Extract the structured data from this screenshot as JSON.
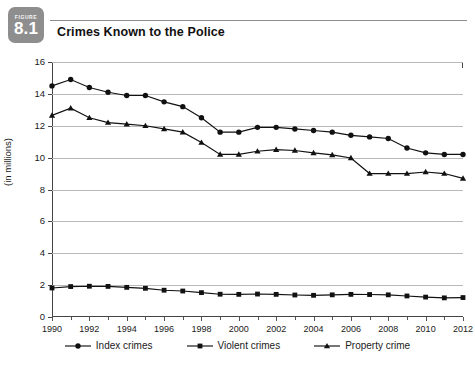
{
  "figure": {
    "badge_word": "FIGURE",
    "badge_number": "8.1",
    "title": "Crimes Known to the Police"
  },
  "chart_data": {
    "type": "line",
    "title": "Crimes Known to the Police",
    "xlabel": "",
    "ylabel": "(in millions)",
    "xlim": [
      1990,
      2012
    ],
    "ylim": [
      0,
      16
    ],
    "ytick_step": 2,
    "xtick_step": 2,
    "grid": true,
    "legend_position": "bottom-center",
    "yticks": [
      "0",
      "2",
      "4",
      "6",
      "8",
      "10",
      "12",
      "14",
      "16"
    ],
    "xticks": [
      "1990",
      "1992",
      "1994",
      "1996",
      "1998",
      "2000",
      "2002",
      "2004",
      "2006",
      "2008",
      "2010",
      "2012"
    ],
    "x": [
      1990,
      1991,
      1992,
      1993,
      1994,
      1995,
      1996,
      1997,
      1998,
      1999,
      2000,
      2001,
      2002,
      2003,
      2004,
      2005,
      2006,
      2007,
      2008,
      2009,
      2010,
      2011,
      2012
    ],
    "series": [
      {
        "name": "Index crimes",
        "marker": "circle",
        "values": [
          14.5,
          14.9,
          14.4,
          14.1,
          13.9,
          13.9,
          13.5,
          13.2,
          12.5,
          11.6,
          11.6,
          11.9,
          11.9,
          11.8,
          11.7,
          11.6,
          11.4,
          11.3,
          11.2,
          10.6,
          10.3,
          10.2,
          10.2
        ]
      },
      {
        "name": "Violent crimes",
        "marker": "square",
        "values": [
          1.82,
          1.91,
          1.93,
          1.92,
          1.86,
          1.8,
          1.68,
          1.63,
          1.53,
          1.43,
          1.42,
          1.44,
          1.42,
          1.38,
          1.36,
          1.39,
          1.42,
          1.41,
          1.39,
          1.32,
          1.25,
          1.2,
          1.22
        ]
      },
      {
        "name": "Property crime",
        "marker": "triangle",
        "values": [
          12.65,
          13.1,
          12.5,
          12.2,
          12.1,
          12.0,
          11.8,
          11.6,
          10.95,
          10.2,
          10.2,
          10.4,
          10.5,
          10.45,
          10.3,
          10.17,
          9.98,
          9.0,
          9.0,
          9.0,
          9.1,
          9.0,
          8.7
        ]
      }
    ]
  }
}
